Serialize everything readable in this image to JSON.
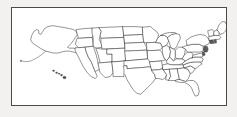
{
  "figure": {
    "kind": "map",
    "projection_note": "Alaska and Hawaii shown as insets at lower left of the continental map",
    "frame": {
      "border_color": "#4a4a4a",
      "background_color": "#ffffff",
      "page_background_color": "#f2f1ef",
      "left": 11,
      "top": 7,
      "width": 216,
      "height": 99
    },
    "style": {
      "boundary_color": "#3b3b3b",
      "fill_color": "#ffffff",
      "highlight_fill_color": "#5a5a5a",
      "boundary_width_px": 0.55
    }
  },
  "map": {
    "country": "United States of America",
    "regions": [
      {
        "id": "continental-us",
        "label": "Contiguous United States"
      },
      {
        "id": "alaska-inset",
        "label": "Alaska"
      },
      {
        "id": "hawaii-inset",
        "label": "Hawaii"
      }
    ],
    "states": [
      "Washington",
      "Oregon",
      "California",
      "Nevada",
      "Idaho",
      "Montana",
      "Wyoming",
      "Utah",
      "Arizona",
      "Colorado",
      "New Mexico",
      "North Dakota",
      "South Dakota",
      "Nebraska",
      "Kansas",
      "Oklahoma",
      "Texas",
      "Minnesota",
      "Iowa",
      "Missouri",
      "Arkansas",
      "Louisiana",
      "Wisconsin",
      "Illinois",
      "Michigan",
      "Indiana",
      "Ohio",
      "Kentucky",
      "Tennessee",
      "Mississippi",
      "Alabama",
      "Georgia",
      "Florida",
      "South Carolina",
      "North Carolina",
      "Virginia",
      "West Virginia",
      "Maryland",
      "Delaware",
      "Pennsylvania",
      "New Jersey",
      "New York",
      "Connecticut",
      "Rhode Island",
      "Massachusetts",
      "Vermont",
      "New Hampshire",
      "Maine",
      "Alaska",
      "Hawaii"
    ],
    "state_count": 50,
    "highlighted_states": [
      "Connecticut",
      "Rhode Island",
      "New Jersey",
      "Delaware"
    ]
  }
}
